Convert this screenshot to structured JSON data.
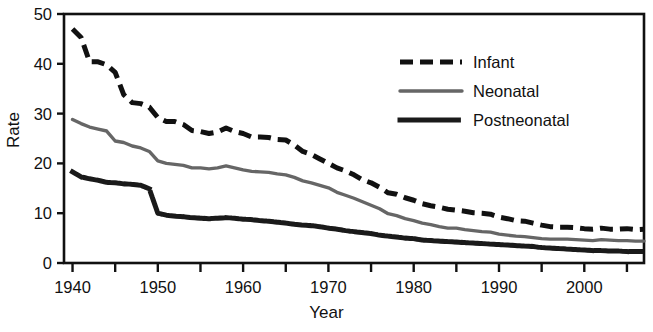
{
  "chart_data": {
    "type": "line",
    "title": "",
    "xlabel": "Year",
    "ylabel": "Rate",
    "xlim": [
      1939,
      2007
    ],
    "ylim": [
      0,
      50
    ],
    "xticks": [
      1940,
      1950,
      1960,
      1970,
      1980,
      1990,
      2000
    ],
    "xtick_labels": [
      "1940",
      "1950",
      "1960",
      "1970",
      "1980",
      "1990",
      "2000"
    ],
    "xminor_step": 5,
    "yticks": [
      0,
      10,
      20,
      30,
      40,
      50
    ],
    "ytick_labels": [
      "0",
      "10",
      "20",
      "30",
      "40",
      "50"
    ],
    "grid": false,
    "legend_position": "top-right",
    "x": [
      1940,
      1941,
      1942,
      1943,
      1944,
      1945,
      1946,
      1947,
      1948,
      1949,
      1950,
      1951,
      1952,
      1953,
      1954,
      1955,
      1956,
      1957,
      1958,
      1959,
      1960,
      1961,
      1962,
      1963,
      1964,
      1965,
      1966,
      1967,
      1968,
      1969,
      1970,
      1971,
      1972,
      1973,
      1974,
      1975,
      1976,
      1977,
      1978,
      1979,
      1980,
      1981,
      1982,
      1983,
      1984,
      1985,
      1986,
      1987,
      1988,
      1989,
      1990,
      1991,
      1992,
      1993,
      1994,
      1995,
      1996,
      1997,
      1998,
      1999,
      2000,
      2001,
      2002,
      2003,
      2004,
      2005,
      2006,
      2007
    ],
    "series": [
      {
        "name": "Infant",
        "style": "dashed",
        "color": "#111111",
        "values": [
          47.0,
          45.3,
          40.4,
          40.4,
          39.8,
          38.3,
          33.8,
          32.2,
          32.0,
          31.3,
          29.2,
          28.4,
          28.4,
          27.8,
          26.6,
          26.4,
          26.0,
          26.3,
          27.1,
          26.4,
          26.0,
          25.3,
          25.3,
          25.2,
          24.8,
          24.7,
          23.7,
          22.4,
          21.8,
          20.9,
          20.0,
          19.1,
          18.5,
          17.7,
          16.7,
          16.1,
          15.2,
          14.1,
          13.8,
          13.1,
          12.6,
          11.9,
          11.5,
          11.2,
          10.8,
          10.6,
          10.4,
          10.1,
          10.0,
          9.8,
          9.2,
          8.9,
          8.5,
          8.4,
          8.0,
          7.6,
          7.3,
          7.2,
          7.2,
          7.1,
          6.9,
          6.8,
          7.0,
          6.8,
          6.8,
          6.9,
          6.7,
          6.8
        ]
      },
      {
        "name": "Neonatal",
        "style": "solid",
        "color": "#666666",
        "values": [
          28.8,
          28.0,
          27.3,
          26.9,
          26.5,
          24.5,
          24.2,
          23.5,
          23.1,
          22.4,
          20.5,
          20.0,
          19.8,
          19.6,
          19.1,
          19.1,
          18.9,
          19.1,
          19.5,
          19.1,
          18.7,
          18.4,
          18.3,
          18.2,
          17.9,
          17.7,
          17.2,
          16.5,
          16.1,
          15.6,
          15.1,
          14.2,
          13.6,
          13.0,
          12.3,
          11.6,
          10.9,
          9.9,
          9.5,
          8.9,
          8.5,
          8.0,
          7.7,
          7.3,
          7.0,
          7.0,
          6.7,
          6.5,
          6.3,
          6.2,
          5.8,
          5.6,
          5.4,
          5.3,
          5.1,
          4.9,
          4.8,
          4.8,
          4.8,
          4.7,
          4.6,
          4.5,
          4.7,
          4.6,
          4.5,
          4.5,
          4.4,
          4.4
        ]
      },
      {
        "name": "Postneonatal",
        "style": "dotted",
        "color": "#1a1a1a",
        "values": [
          18.3,
          17.3,
          16.9,
          16.6,
          16.2,
          16.1,
          15.9,
          15.8,
          15.6,
          14.9,
          10.0,
          9.6,
          9.4,
          9.3,
          9.1,
          9.0,
          8.9,
          9.0,
          9.1,
          9.0,
          8.8,
          8.7,
          8.5,
          8.4,
          8.2,
          8.0,
          7.8,
          7.6,
          7.5,
          7.3,
          7.0,
          6.8,
          6.5,
          6.3,
          6.1,
          5.9,
          5.6,
          5.4,
          5.2,
          5.0,
          4.9,
          4.6,
          4.5,
          4.4,
          4.3,
          4.2,
          4.1,
          4.0,
          3.9,
          3.8,
          3.7,
          3.6,
          3.5,
          3.4,
          3.3,
          3.1,
          3.0,
          2.9,
          2.8,
          2.7,
          2.6,
          2.5,
          2.5,
          2.4,
          2.4,
          2.3,
          2.3,
          2.3
        ]
      }
    ]
  },
  "legend": {
    "entries": [
      {
        "label": "Infant"
      },
      {
        "label": "Neonatal"
      },
      {
        "label": "Postneonatal"
      }
    ]
  }
}
